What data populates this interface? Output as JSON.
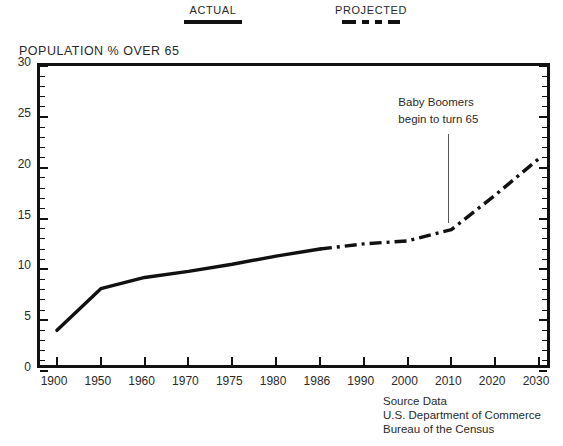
{
  "legend": {
    "entries": [
      {
        "label": "ACTUAL",
        "style": "solid"
      },
      {
        "label": "PROJECTED",
        "style": "dash-dot"
      }
    ]
  },
  "axis_title": "POPULATION  % OVER 65",
  "annotation": {
    "line1": "Baby Boomers",
    "line2": "begin to turn 65",
    "points_to": "2010"
  },
  "source": {
    "line1": "Source Data",
    "line2": "U.S. Department of Commerce",
    "line3": "Bureau of the Census"
  },
  "chart_data": {
    "type": "line",
    "title": "POPULATION  % OVER 65",
    "xlabel": "",
    "ylabel": "POPULATION  % OVER 65",
    "ylim": [
      0,
      30
    ],
    "ytick_step": 5,
    "yminor_step": 1,
    "grid": false,
    "legend_position": "top",
    "x_axis_kind": "ordinal",
    "categories": [
      "1900",
      "1950",
      "1960",
      "1970",
      "1975",
      "1980",
      "1986",
      "1990",
      "2000",
      "2010",
      "2020",
      "2030"
    ],
    "ytick_labels": [
      "0",
      "5",
      "10",
      "15",
      "20",
      "25",
      "30"
    ],
    "series": [
      {
        "name": "ACTUAL",
        "style": "solid",
        "x": [
          "1900",
          "1950",
          "1960",
          "1970",
          "1975",
          "1980",
          "1986"
        ],
        "values": [
          4.0,
          8.1,
          9.2,
          9.8,
          10.5,
          11.3,
          12.0
        ]
      },
      {
        "name": "PROJECTED",
        "style": "dash-dot",
        "x": [
          "1986",
          "1990",
          "2000",
          "2010",
          "2020",
          "2030"
        ],
        "values": [
          12.0,
          12.5,
          12.8,
          13.9,
          17.3,
          20.9
        ]
      }
    ],
    "annotations": [
      {
        "text": "Baby Boomers begin to turn 65",
        "x": "2010",
        "y": 13.9
      }
    ]
  }
}
